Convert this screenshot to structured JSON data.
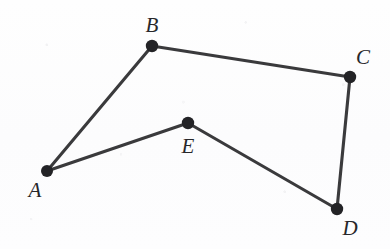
{
  "figure": {
    "background_color": "#fdfdfd",
    "stroke_color": "#3a3a3c",
    "vertex_color": "#232326",
    "width": 390,
    "height": 249
  },
  "vertices": [
    {
      "id": "A",
      "label": "A",
      "x": 47,
      "y": 171,
      "label_x": 35,
      "label_y": 190,
      "radius": 6.0
    },
    {
      "id": "B",
      "label": "B",
      "x": 152,
      "y": 46,
      "label_x": 152,
      "label_y": 25,
      "radius": 6.2
    },
    {
      "id": "C",
      "label": "C",
      "x": 350,
      "y": 77,
      "label_x": 363,
      "label_y": 57,
      "radius": 6.2
    },
    {
      "id": "D",
      "label": "D",
      "x": 337,
      "y": 209,
      "label_x": 350,
      "label_y": 228,
      "radius": 6.2
    },
    {
      "id": "E",
      "label": "E",
      "x": 188,
      "y": 123,
      "label_x": 188,
      "label_y": 146,
      "radius": 6.2
    }
  ],
  "edges": [
    {
      "id": "AB",
      "from": "A",
      "to": "B",
      "x1": 47,
      "y1": 171,
      "x2": 152,
      "y2": 46
    },
    {
      "id": "BC",
      "from": "B",
      "to": "C",
      "x1": 152,
      "y1": 46,
      "x2": 350,
      "y2": 77
    },
    {
      "id": "CD",
      "from": "C",
      "to": "D",
      "x1": 350,
      "y1": 77,
      "x2": 337,
      "y2": 209
    },
    {
      "id": "DE",
      "from": "D",
      "to": "E",
      "x1": 337,
      "y1": 209,
      "x2": 188,
      "y2": 123
    },
    {
      "id": "EA",
      "from": "E",
      "to": "A",
      "x1": 188,
      "y1": 123,
      "x2": 47,
      "y2": 171
    }
  ]
}
